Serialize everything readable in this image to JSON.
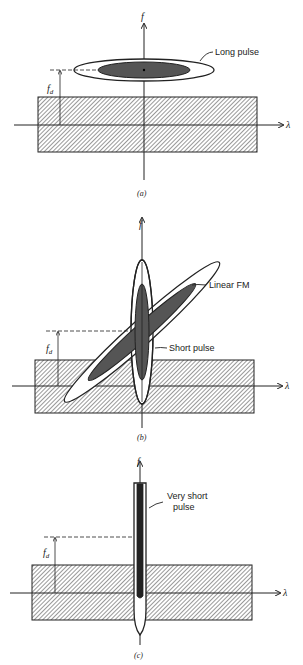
{
  "figure": {
    "panels": [
      {
        "id": "a",
        "caption": "(a)",
        "y_axis_label": "f",
        "x_axis_label": "λ",
        "offset_label": "f_d",
        "offset_label_main": "f",
        "offset_label_sub": "d",
        "annotations": [
          "Long pulse"
        ]
      },
      {
        "id": "b",
        "caption": "(b)",
        "y_axis_label": "f",
        "x_axis_label": "λ",
        "offset_label": "f_d",
        "offset_label_main": "f",
        "offset_label_sub": "d",
        "annotations": [
          "Linear FM",
          "Short pulse"
        ]
      },
      {
        "id": "c",
        "caption": "(c)",
        "y_axis_label": "f",
        "x_axis_label": "λ",
        "offset_label": "f_d",
        "offset_label_main": "f",
        "offset_label_sub": "d",
        "annotations": [
          "Very short",
          "pulse"
        ]
      }
    ],
    "colors": {
      "ink": "#222222",
      "dark_fill": "#555555",
      "very_dark_fill": "#222222",
      "background": "#ffffff"
    }
  }
}
